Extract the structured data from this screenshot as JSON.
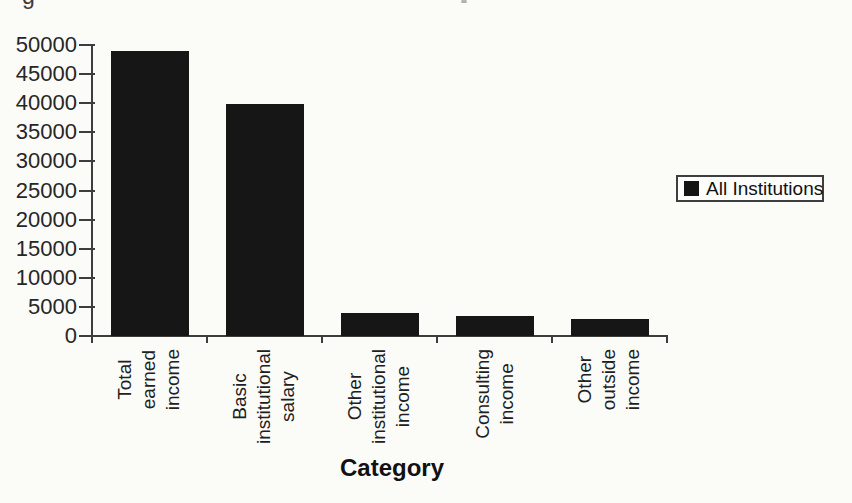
{
  "page": {
    "background": "#fbfbf8"
  },
  "cropped_top_line": {
    "fragment": "g",
    "speck": ","
  },
  "chart_data": {
    "type": "bar",
    "title": "",
    "categories": [
      "Total earned income",
      "Basic institutional salary",
      "Other institutional income",
      "Consulting income",
      "Other outside income"
    ],
    "category_label_lines": [
      "Total\nearned\nincome",
      "Basic\ninstitutional\nsalary",
      "Other\ninstitutional\nincome",
      "Consulting\nincome",
      "Other\noutside\nincome"
    ],
    "series": [
      {
        "name": "All Institutions",
        "values": [
          49000,
          39800,
          4000,
          3500,
          2900
        ]
      }
    ],
    "xlabel": "Category",
    "ylabel": "",
    "ylim": [
      0,
      50000
    ],
    "yticks": [
      0,
      5000,
      10000,
      15000,
      20000,
      25000,
      30000,
      35000,
      40000,
      45000,
      50000
    ],
    "grid": false,
    "bar_color": "#161616",
    "axis_color": "#3d3d3d",
    "legend": {
      "label": "All Institutions",
      "position": "right",
      "marker_color": "#141414",
      "boxed": true
    }
  }
}
